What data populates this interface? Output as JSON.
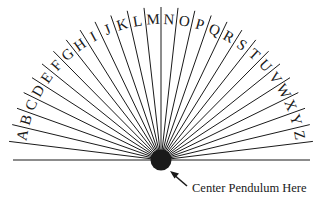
{
  "diagram": {
    "letters": [
      "A",
      "B",
      "C",
      "D",
      "E",
      "F",
      "G",
      "H",
      "I",
      "J",
      "K",
      "L",
      "M",
      "N",
      "O",
      "P",
      "Q",
      "R",
      "S",
      "T",
      "U",
      "V",
      "W",
      "X",
      "Y",
      "Z"
    ],
    "caption": "Center Pendulum Here",
    "caption_pointer": "arrow-pointing-to-center",
    "colors": {
      "ink": "#1a1a1a",
      "background": "#ffffff"
    }
  }
}
